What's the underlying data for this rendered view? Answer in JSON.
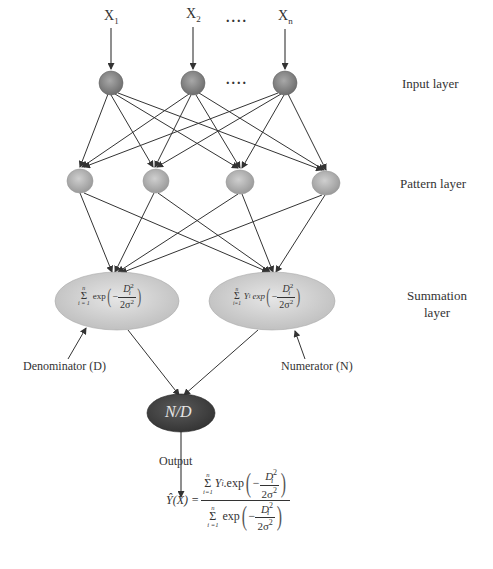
{
  "diagram": {
    "inputs": [
      {
        "label": "X",
        "sub": "1"
      },
      {
        "label": "X",
        "sub": "2"
      },
      {
        "label": "X",
        "sub": "n"
      }
    ],
    "ellipsis": "....",
    "layers": {
      "input": "Input layer",
      "pattern": "Pattern layer",
      "summation_line1": "Summation",
      "summation_line2": "layer"
    },
    "summation_nodes": {
      "denominator_label": "Denominator (D)",
      "numerator_label": "Numerator (N)",
      "denominator_formula": {
        "sum_upper": "n",
        "sum_lower": "i = 1",
        "func": "exp",
        "minus": "−",
        "num": "D",
        "num_sup": "2",
        "num_sub": "i",
        "den": "2σ",
        "den_sup": "2"
      },
      "numerator_formula": {
        "sum_upper": "n",
        "sum_lower": "i=1",
        "coef": "Y",
        "coef_sub": "i",
        "func": "exp",
        "minus": "−",
        "num": "D",
        "num_sup": "2",
        "num_sub": "i",
        "den": "2σ",
        "den_sup": "2"
      }
    },
    "output_node": {
      "label": "N/D"
    },
    "output_label": "Output",
    "output_formula": {
      "lhs": "Ŷ(X) =",
      "numerator": {
        "sum_upper": "n",
        "sum_lower": "i=1",
        "coef": "Y",
        "coef_sub": "i",
        "func": ".exp"
      },
      "denominator": {
        "sum_upper": "n",
        "sum_lower": "i =1",
        "func": "exp"
      },
      "minus": "−",
      "num": "D",
      "num_sup": "2",
      "num_sub": "i",
      "den": "2σ",
      "den_sup": "2"
    },
    "colors": {
      "input_node": "#8a8a8a",
      "pattern_node": "#b5b5b5",
      "summation_node": "#d4d4d4",
      "output_node": "#4a4a4a",
      "edge": "#333333"
    }
  }
}
